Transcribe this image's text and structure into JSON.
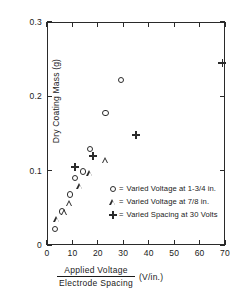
{
  "chart_data": {
    "type": "scatter",
    "title": "",
    "xlabel": "Applied Voltage / Electrode Spacing (V/in.)",
    "ylabel": "Dry Coating Mass (g)",
    "xlim": [
      0,
      70
    ],
    "ylim": [
      0,
      0.3
    ],
    "xticks": [
      0,
      10,
      20,
      30,
      40,
      50,
      60,
      70
    ],
    "xticklabels": [
      "0",
      "10",
      "20",
      "30",
      "40",
      "50",
      "60",
      "70"
    ],
    "yticks": [
      0,
      0.1,
      0.2,
      0.3
    ],
    "yticklabels": [
      "0",
      "0.1",
      "0.2",
      "0.3"
    ],
    "grid": false,
    "legend_position": "center-right-inside",
    "series": [
      {
        "name": "Varied Voltage at 1-3/4 in.",
        "marker": "circle",
        "points": [
          [
            3,
            0.022
          ],
          [
            6,
            0.045
          ],
          [
            9,
            0.068
          ],
          [
            11,
            0.09
          ],
          [
            14,
            0.099
          ],
          [
            17,
            0.129
          ],
          [
            23,
            0.178
          ],
          [
            29,
            0.222
          ]
        ]
      },
      {
        "name": "Varied Voltage at 7/8 in.",
        "marker": "triangle",
        "points": [
          [
            4,
            0.035
          ],
          [
            7,
            0.044
          ],
          [
            9,
            0.056
          ],
          [
            13,
            0.079
          ],
          [
            17,
            0.096
          ],
          [
            23,
            0.114
          ]
        ]
      },
      {
        "name": "Varied Spacing at 30 Volts",
        "marker": "plus",
        "points": [
          [
            11,
            0.105
          ],
          [
            18,
            0.12
          ],
          [
            35,
            0.148
          ],
          [
            69,
            0.245
          ]
        ]
      }
    ]
  },
  "axes": {
    "ylabel_text": "Dry Coating Mass (g)",
    "xlabel_numerator": "Applied  Voltage",
    "xlabel_denominator": "Electrode  Spacing",
    "xlabel_units": "(V/in.)"
  },
  "legend": {
    "entries": [
      {
        "symbol": "circle",
        "equals": "=",
        "label": "Varied Voltage at 1-3/4 in."
      },
      {
        "symbol": "triangle",
        "equals": "=",
        "label": "Varied Voltage at 7/8 in."
      },
      {
        "symbol": "plus",
        "equals": "=",
        "label": "Varied Spacing at 30 Volts"
      }
    ]
  },
  "colors": {
    "ink": "#2a2a2a",
    "background": "#ffffff"
  }
}
